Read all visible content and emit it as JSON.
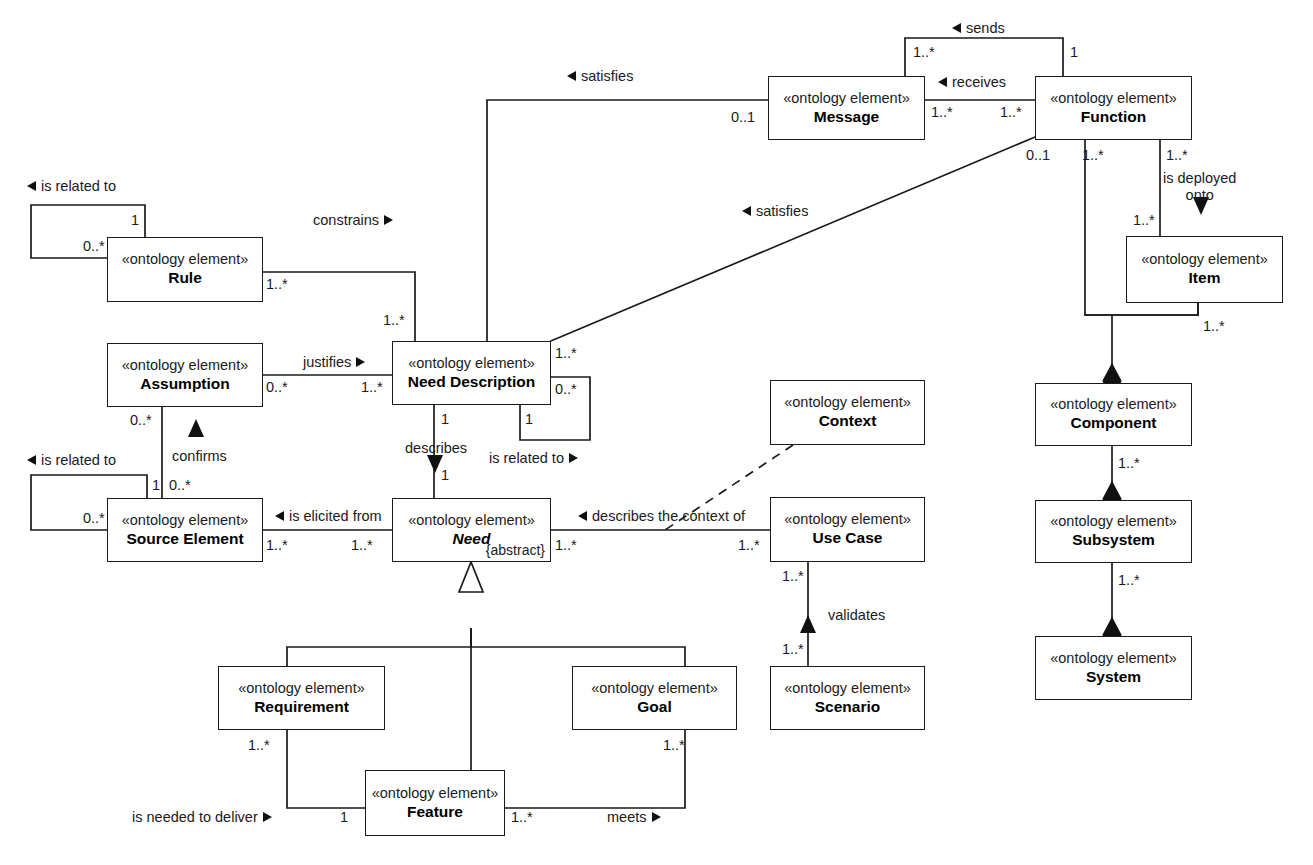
{
  "diagram": {
    "stereotype": "«ontology element»",
    "abstract_tag": "{abstract}",
    "colors": {
      "line": "#1a1a1a",
      "fill": "#ffffff",
      "text": "#000000"
    }
  },
  "classes": [
    {
      "id": "message",
      "stereotype": "«ontology element»",
      "name": "Message",
      "abstract": false
    },
    {
      "id": "function",
      "stereotype": "«ontology element»",
      "name": "Function",
      "abstract": false
    },
    {
      "id": "item",
      "stereotype": "«ontology element»",
      "name": "Item",
      "abstract": false
    },
    {
      "id": "component",
      "stereotype": "«ontology element»",
      "name": "Component",
      "abstract": false
    },
    {
      "id": "subsystem",
      "stereotype": "«ontology element»",
      "name": "Subsystem",
      "abstract": false
    },
    {
      "id": "system",
      "stereotype": "«ontology element»",
      "name": "System",
      "abstract": false
    },
    {
      "id": "rule",
      "stereotype": "«ontology element»",
      "name": "Rule",
      "abstract": false
    },
    {
      "id": "assumption",
      "stereotype": "«ontology element»",
      "name": "Assumption",
      "abstract": false
    },
    {
      "id": "need_desc",
      "stereotype": "«ontology element»",
      "name": "Need Description",
      "abstract": false
    },
    {
      "id": "source_elem",
      "stereotype": "«ontology element»",
      "name": "Source Element",
      "abstract": false
    },
    {
      "id": "need",
      "stereotype": "«ontology element»",
      "name": "Need",
      "abstract": true
    },
    {
      "id": "context",
      "stereotype": "«ontology element»",
      "name": "Context",
      "abstract": false
    },
    {
      "id": "use_case",
      "stereotype": "«ontology element»",
      "name": "Use Case",
      "abstract": false
    },
    {
      "id": "scenario",
      "stereotype": "«ontology element»",
      "name": "Scenario",
      "abstract": false
    },
    {
      "id": "requirement",
      "stereotype": "«ontology element»",
      "name": "Requirement",
      "abstract": false
    },
    {
      "id": "goal",
      "stereotype": "«ontology element»",
      "name": "Goal",
      "abstract": false
    },
    {
      "id": "feature",
      "stereotype": "«ontology element»",
      "name": "Feature",
      "abstract": false
    }
  ],
  "association_labels": {
    "sends": "sends",
    "receives": "receives",
    "satisfies_msg": "satisfies",
    "satisfies_fn": "satisfies",
    "is_deployed_onto_1": "is deployed",
    "is_deployed_onto_2": "onto",
    "constrains": "constrains",
    "justifies": "justifies",
    "confirms": "confirms",
    "describes": "describes",
    "is_related_to_rule": "is related to",
    "is_related_to_src": "is related to",
    "is_related_to_nd": "is related to",
    "is_elicited_from": "is elicited from",
    "describes_context_of": "describes the context of",
    "validates": "validates",
    "is_needed_to_deliver": "is needed to deliver",
    "meets": "meets"
  },
  "multiplicities": {
    "sends_msg": "1..*",
    "sends_fn": "1",
    "receives_msg": "1..*",
    "receives_fn": "1..*",
    "satisfies_msg_nd": "0..1",
    "satisfies_fn_left": "0..1",
    "satisfies_nd": "1..*",
    "fn_item_a": "1..*",
    "fn_item_b": "1..*",
    "item_top": "1..*",
    "item_bottom": "1..*",
    "fn_comp": "1..*",
    "comp_sub": "1..*",
    "sub_sys": "1..*",
    "rule_loop_1": "1",
    "rule_loop_0": "0..*",
    "rule_nd": "1..*",
    "constrains_nd": "1..*",
    "justifies_a": "0..*",
    "justifies_nd": "1..*",
    "confirms_a": "0..*",
    "confirms_src_1": "1",
    "confirms_src_0": "0..*",
    "src_loop_0": "0..*",
    "describes_nd": "1",
    "describes_need": "1",
    "nd_loop_0": "0..*",
    "nd_loop_1": "1",
    "elicited_src": "1..*",
    "elicited_need": "1..*",
    "ctx_need": "1..*",
    "ctx_uc": "1..*",
    "uc_scn_top": "1..*",
    "uc_scn_bot": "1..*",
    "req_feat": "1..*",
    "goal_feat": "1..*",
    "feat_left": "1",
    "feat_right": "1..*"
  }
}
